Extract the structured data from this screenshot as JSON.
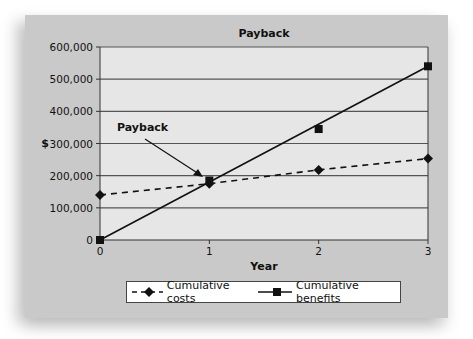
{
  "chart_data": {
    "type": "line",
    "title": "Payback",
    "xlabel": "Year",
    "ylabel": "$",
    "x": [
      0,
      1,
      2,
      3
    ],
    "x_ticks": [
      "0",
      "1",
      "2",
      "3"
    ],
    "y_ticks": [
      "0",
      "100,000",
      "200,000",
      "300,000",
      "400,000",
      "500,000",
      "600,000"
    ],
    "ylim": [
      0,
      600000
    ],
    "xlim": [
      0,
      3
    ],
    "grid": true,
    "legend_position": "bottom",
    "series": [
      {
        "name": "Cumulative costs",
        "style": "dashed",
        "marker": "diamond",
        "values": [
          140000,
          175000,
          218000,
          253000
        ]
      },
      {
        "name": "Cumulative benefits",
        "style": "solid",
        "marker": "square",
        "values": [
          0,
          185000,
          345000,
          540000
        ]
      }
    ],
    "annotations": [
      {
        "text": "Payback",
        "points_to": {
          "x": 1,
          "y": 180000
        }
      }
    ]
  },
  "colors": {
    "panel": "#c9c9c9",
    "plot_area": "#e6e6e6",
    "grid": "#555555",
    "series": "#111111"
  }
}
